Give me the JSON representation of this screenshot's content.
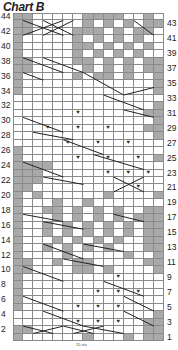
{
  "title": "Chart B",
  "footer_label": "15 sts",
  "colors": {
    "shaded": "#a9a9a9",
    "grid": "#8a8a8a",
    "background": "#ffffff"
  },
  "grid": {
    "cols": 15,
    "rows": 44
  },
  "row_labels_left": [
    "44",
    "42",
    "40",
    "38",
    "36",
    "34",
    "32",
    "30",
    "28",
    "26",
    "24",
    "22",
    "20",
    "18",
    "16",
    "14",
    "12",
    "10",
    "8",
    "6",
    "4",
    "2"
  ],
  "row_labels_right": [
    "43",
    "41",
    "39",
    "37",
    "35",
    "33",
    "31",
    "29",
    "27",
    "25",
    "23",
    "21",
    "19",
    "17",
    "15",
    "13",
    "11",
    "9",
    "7",
    "5",
    "3",
    "1"
  ],
  "legend_symbols": {
    "shaded": "gray-cell",
    "purl": "v-symbol",
    "cable": "diagonal-cross"
  },
  "rows_top_to_bottom": [
    "gg.....gggg..g",
    "gg.....g.g.g.gg",
    "gg....ggg.g.gg.",
    "g.....g.g.g.g..",
    "g.....gg.g.g.g.",
    "g.....g.g.g.g..",
    "gg....gg.g.g.gg",
    "gg.....g.g.g.gg",
    "g.....g.gg.g..g",
    "g.............g",
    "g.............g",
    "...............",
    "..............g",
    "......v......gg",
    "..............gg",
    "...v..v..v...gg",
    "..............g",
    ".....v..v..v...",
    "g..............",
    "g.....v..v..v.g",
    "gggg...........",
    "ggg......v.v.v.",
    "ggg............",
    "gg..........v..",
    "g.g......g....g",
    "g...g..g.......",
    "g..gg.g.g.g..gg",
    "g...g.g.g.g.ggg",
    "g..g.g.g.g.g.gg",
    "g..g.g.g.g.g.gg",
    "g...g.g.g.g..gg",
    "g..g.g.g.g...gg",
    "g....g.....g..g",
    "gg..g.gg.....gg",
    "gg....gg.g....g",
    "g.........v....",
    "g..............",
    "g.......v.v.v..",
    "g..............",
    "g.....v.v.v....",
    "..............g",
    "......v.v.v..gg",
    "gg...........gg",
    "g......g...g.gg"
  ],
  "cables": [
    [
      1,
      43,
      5,
      41
    ],
    [
      1,
      41,
      5,
      43
    ],
    [
      3,
      43,
      6,
      41
    ],
    [
      3,
      41,
      6,
      43
    ],
    [
      12,
      43,
      14,
      41
    ],
    [
      1,
      38,
      5,
      36
    ],
    [
      3,
      38,
      7,
      36
    ],
    [
      7,
      36,
      11,
      33
    ],
    [
      11,
      33,
      14,
      34
    ],
    [
      1,
      36,
      3,
      35
    ],
    [
      9,
      33,
      13,
      31
    ],
    [
      11,
      31,
      14,
      30
    ],
    [
      1,
      30,
      5,
      28
    ],
    [
      2,
      28,
      6,
      27
    ],
    [
      5,
      27,
      9,
      25
    ],
    [
      8,
      25,
      13,
      23
    ],
    [
      1,
      24,
      5,
      22
    ],
    [
      3,
      22,
      7,
      21
    ],
    [
      10,
      22,
      13,
      20
    ],
    [
      10,
      20,
      13,
      22
    ],
    [
      1,
      17,
      5,
      16
    ],
    [
      3,
      16,
      7,
      15
    ],
    [
      10,
      17,
      13,
      16
    ],
    [
      3,
      13,
      7,
      11
    ],
    [
      5,
      11,
      9,
      10
    ],
    [
      7,
      13,
      11,
      12
    ],
    [
      1,
      10,
      5,
      8
    ],
    [
      9,
      8,
      13,
      6
    ],
    [
      11,
      6,
      14,
      4
    ],
    [
      1,
      6,
      5,
      4
    ],
    [
      3,
      4,
      7,
      2
    ],
    [
      7,
      2,
      11,
      1
    ],
    [
      11,
      4,
      14,
      2
    ],
    [
      1,
      2,
      4,
      1
    ],
    [
      2,
      1,
      5,
      2
    ],
    [
      5,
      2,
      8,
      1
    ],
    [
      6,
      1,
      9,
      2
    ]
  ]
}
